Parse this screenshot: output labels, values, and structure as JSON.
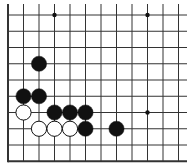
{
  "board": {
    "title": "Go board diagram (lower-left corner section)",
    "background": "#ffffff",
    "line_color": "#333333",
    "origin_x": 8,
    "origin_y": 15,
    "spacing_x": 15.5,
    "spacing_y": 16.25,
    "cols": 12,
    "rows": 10,
    "right_extension": 187,
    "top_extension": 4,
    "edges": [
      "left",
      "bottom"
    ],
    "stone_radius": 7.6,
    "star_points": [
      {
        "col": 3,
        "row": 0
      },
      {
        "col": 9,
        "row": 0
      },
      {
        "col": 9,
        "row": 6
      }
    ],
    "stones": [
      {
        "color": "black",
        "col": 2,
        "row": 3
      },
      {
        "color": "black",
        "col": 1,
        "row": 5
      },
      {
        "color": "black",
        "col": 2,
        "row": 5
      },
      {
        "color": "white",
        "col": 1,
        "row": 6
      },
      {
        "color": "black",
        "col": 3,
        "row": 6
      },
      {
        "color": "black",
        "col": 4,
        "row": 6
      },
      {
        "color": "black",
        "col": 5,
        "row": 6
      },
      {
        "color": "white",
        "col": 2,
        "row": 7
      },
      {
        "color": "white",
        "col": 3,
        "row": 7
      },
      {
        "color": "white",
        "col": 4,
        "row": 7
      },
      {
        "color": "black",
        "col": 5,
        "row": 7
      },
      {
        "color": "black",
        "col": 7,
        "row": 7
      }
    ]
  }
}
